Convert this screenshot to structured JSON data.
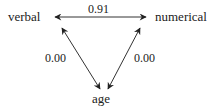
{
  "diagram": {
    "nodes": {
      "verbal": "verbal",
      "numerical": "numerical",
      "age": "age"
    },
    "edges": [
      {
        "from": "verbal",
        "to": "numerical",
        "type": "bidirectional",
        "label": "0.91"
      },
      {
        "from": "verbal",
        "to": "age",
        "type": "bidirectional",
        "label": "0.00"
      },
      {
        "from": "numerical",
        "to": "age",
        "type": "bidirectional",
        "label": "0.00"
      }
    ],
    "colors": {
      "line": "#333333",
      "text": "#222222",
      "background": "#ffffff"
    }
  }
}
